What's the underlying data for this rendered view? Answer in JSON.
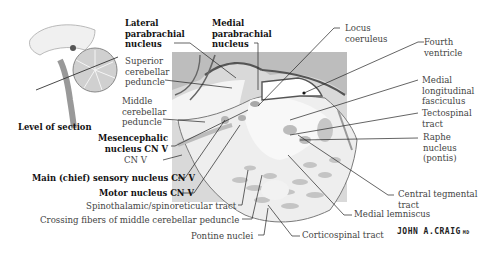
{
  "figure": {
    "inset_caption": "Level of section",
    "signature": "JOHN A.CRAIG",
    "signature_suffix": "MD"
  },
  "labels_left": {
    "lateral_parabrachial": [
      "Lateral",
      "parabrachial",
      "nucleus"
    ],
    "medial_parabrachial": [
      "Medial",
      "parabrachial",
      "nucleus"
    ],
    "superior_cerebellar_peduncle": [
      "Superior",
      "cerebellar",
      "peduncle"
    ],
    "middle_cerebellar_peduncle": [
      "Middle",
      "cerebellar",
      "peduncle"
    ],
    "mesencephalic_nucleus": [
      "Mesencephalic",
      "nucleus CN V"
    ],
    "cn_v": "CN V",
    "main_sensory_nucleus": "Main (chief) sensory nucleus CN V",
    "motor_nucleus": "Motor nucleus CN V",
    "spinothalamic": "Spinothalamic/spinoreticular tract",
    "crossing_fibers": "Crossing fibers of middle cerebellar peduncle",
    "pontine_nuclei": "Pontine nuclei"
  },
  "labels_right": {
    "locus_coeruleus": [
      "Locus",
      "coeruleus"
    ],
    "fourth_ventricle": [
      "Fourth",
      "ventricle"
    ],
    "mlf": [
      "Medial",
      "longitudinal",
      "fasciculus"
    ],
    "tectospinal": [
      "Tectospinal",
      "tract"
    ],
    "raphe": [
      "Raphe",
      "nucleus",
      "(pontis)"
    ],
    "central_tegmental": [
      "Central tegmental",
      "tract"
    ],
    "medial_lemniscus": "Medial lemniscus",
    "corticospinal": "Corticospinal tract"
  },
  "colors": {
    "tissue_light": "#f1f1f1",
    "tissue_mid": "#d4d4d4",
    "tissue_dark": "#a9a9a9",
    "outline": "#5a5a5a",
    "leader": "#222222",
    "text_bold": "#111111",
    "text_regular": "#444444"
  }
}
